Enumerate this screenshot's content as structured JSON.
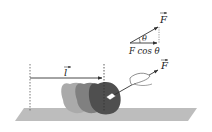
{
  "diagram": {
    "labels": {
      "force_top": "F",
      "angle": "θ",
      "component": "F cos θ",
      "component_F": "F",
      "component_cos": "cos",
      "component_theta": "θ",
      "displacement": "l",
      "force_main": "F"
    },
    "colors": {
      "ground": "#b9b9b9",
      "object_light": "#a6a6a6",
      "object_mid": "#7a7a7a",
      "object_dark": "#4d4d4d",
      "line": "#333333"
    }
  }
}
